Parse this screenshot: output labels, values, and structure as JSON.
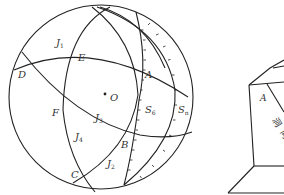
{
  "figure": {
    "stereonet": {
      "center_label": "O",
      "points": {
        "A": "A",
        "B": "B",
        "C": "C",
        "D": "D",
        "E": "E",
        "F": "F"
      },
      "planes": {
        "J1": {
          "base": "J",
          "sub": "1"
        },
        "J2": {
          "base": "J",
          "sub": "2"
        },
        "J3": {
          "base": "J",
          "sub": "3"
        },
        "J4": {
          "base": "J",
          "sub": "4"
        },
        "S6": {
          "base": "S",
          "sub": "6"
        },
        "Sn": {
          "base": "S",
          "sub": "n"
        }
      }
    },
    "block": {
      "vertex_label": "A",
      "partial_text_1": "洞",
      "partial_text_2": "向"
    },
    "colors": {
      "line": "#222222",
      "background": "#ffffff"
    }
  }
}
